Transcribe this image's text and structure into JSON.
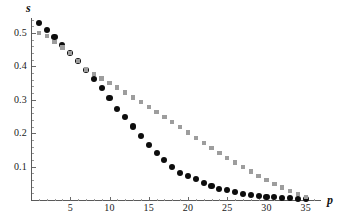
{
  "chart_data": {
    "type": "scatter",
    "title": "",
    "subtitle": "",
    "xlabel": "p",
    "ylabel": "s",
    "xlim": [
      0,
      36.5
    ],
    "ylim": [
      0,
      0.56
    ],
    "xticks": [
      5,
      10,
      15,
      20,
      25,
      30,
      35
    ],
    "yticks": [
      0.1,
      0.2,
      0.3,
      0.4,
      0.5
    ],
    "xtick_labels": [
      "5",
      "10",
      "15",
      "20",
      "25",
      "30",
      "35"
    ],
    "ytick_labels": [
      "0.1",
      "0.2",
      "0.3",
      "0.4",
      "0.5"
    ],
    "grid": false,
    "legend": "none",
    "legend_position": "none",
    "x": [
      1,
      2,
      3,
      4,
      5,
      6,
      7,
      8,
      9,
      10,
      11,
      12,
      13,
      14,
      15,
      16,
      17,
      18,
      19,
      20,
      21,
      22,
      23,
      24,
      25,
      26,
      27,
      28,
      29,
      30,
      31,
      32,
      33,
      34,
      35
    ],
    "series": [
      {
        "name": "black-circles",
        "marker": "circle",
        "color": "#0d0d0d",
        "marker_size_px": 6.2,
        "values": [
          0.53,
          0.508,
          0.487,
          0.464,
          0.44,
          0.415,
          0.389,
          0.362,
          0.335,
          0.306,
          0.272,
          0.248,
          0.22,
          0.191,
          0.165,
          0.141,
          0.119,
          0.099,
          0.082,
          0.071,
          0.062,
          0.05,
          0.041,
          0.033,
          0.029,
          0.023,
          0.019,
          0.015,
          0.012,
          0.01,
          0.008,
          0.006,
          0.005,
          0.004,
          0.003
        ]
      },
      {
        "name": "gray-squares",
        "marker": "square",
        "color": "#9d9d9d",
        "marker_size_px": 4.4,
        "values": [
          0.5,
          0.49,
          0.473,
          0.457,
          0.44,
          0.416,
          0.391,
          0.377,
          0.364,
          0.351,
          0.337,
          0.322,
          0.307,
          0.293,
          0.278,
          0.263,
          0.248,
          0.233,
          0.218,
          0.202,
          0.186,
          0.171,
          0.156,
          0.141,
          0.126,
          0.112,
          0.098,
          0.085,
          0.072,
          0.06,
          0.048,
          0.037,
          0.027,
          0.018,
          0.009
        ]
      }
    ]
  }
}
